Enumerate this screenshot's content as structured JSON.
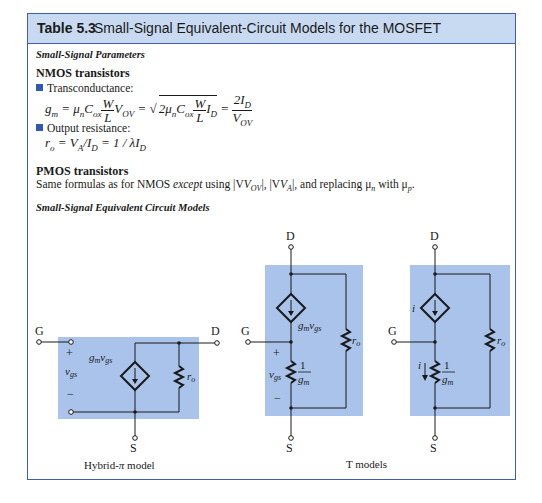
{
  "table": {
    "number": "Table 5.3",
    "title": "Small-Signal Equivalent-Circuit Models for the MOSFET"
  },
  "parameters": {
    "section_heading": "Small-Signal Parameters",
    "nmos": {
      "heading": "NMOS transistors",
      "transconductance_label": "Transconductance:",
      "transconductance_formula": "g_m = μ_n C_ox (W/L) V_OV = sqrt(2 μ_n C_ox (W/L) I_D) = 2 I_D / V_OV",
      "output_resistance_label": "Output resistance:",
      "output_resistance_formula": "r_o = V_A / I_D = 1 / λ I_D"
    },
    "pmos": {
      "heading": "PMOS transistors",
      "text_part1": "Same formulas as for NMOS ",
      "text_except": "except",
      "text_part2": " using |V",
      "text_part3": "|, |V",
      "text_part4": "|, and replacing μ",
      "text_part5": " with μ",
      "text_end": ".",
      "full_text": "Same formulas as for NMOS except using |V_OV|, |V_A|, and replacing μ_n with μ_p."
    }
  },
  "circuits": {
    "section_heading": "Small-Signal Equivalent Circuit Models",
    "hybrid_pi": {
      "caption": "Hybrid-π model",
      "terminals": {
        "gate": "G",
        "drain": "D",
        "source": "S"
      },
      "source_label": "g_m v_gs",
      "resistor_label": "r_o",
      "control_voltage": "v_gs",
      "plus": "+",
      "minus": "−"
    },
    "t_models": {
      "caption": "T models",
      "model_1": {
        "terminals": {
          "gate": "G",
          "drain": "D",
          "source": "S"
        },
        "source_label": "g_m v_gs",
        "series_resistor_label": "1/g_m",
        "resistor_label": "r_o",
        "control_voltage": "v_gs",
        "plus": "+",
        "minus": "−"
      },
      "model_2": {
        "terminals": {
          "gate": "G",
          "drain": "D",
          "source": "S"
        },
        "source_label": "i",
        "series_resistor_label": "1/g_m",
        "resistor_label": "r_o",
        "current_label": "i"
      }
    }
  },
  "colors": {
    "frame_border": "#3d5fae",
    "header_fill": "#c8daf1",
    "circuit_fill": "#a9c3ea",
    "bullet": "#2f59b5"
  }
}
